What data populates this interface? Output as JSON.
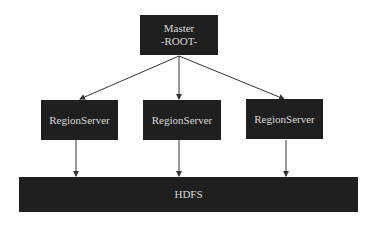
{
  "master": {
    "line1": "Master",
    "line2": "-ROOT-"
  },
  "region_servers": [
    {
      "label": "RegionServer"
    },
    {
      "label": "RegionServer"
    },
    {
      "label": "RegionServer"
    }
  ],
  "storage": {
    "label": "HDFS"
  },
  "colors": {
    "box_fill": "#1f1f1f",
    "box_text": "#d8d8d8",
    "edge": "#333333"
  }
}
